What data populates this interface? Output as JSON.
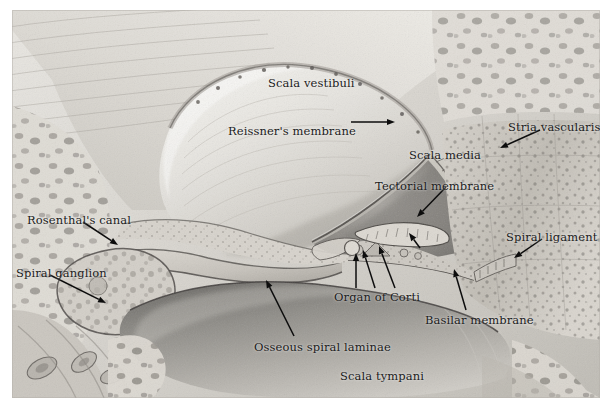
{
  "figure": {
    "background_color": "#ffffff",
    "plate_tone": "#cfcdc8",
    "label_color": "#1b1b1b"
  },
  "labels": [
    {
      "id": "scala-vestibuli",
      "text": "Scala vestibuli",
      "x": 268,
      "y": 78,
      "has_arrow": false
    },
    {
      "id": "reissners-membrane",
      "text": "Reissner's membrane",
      "x": 228,
      "y": 126,
      "has_arrow": true
    },
    {
      "id": "stria-vascularis",
      "text": "Stria vascularis",
      "x": 508,
      "y": 122,
      "has_arrow": true
    },
    {
      "id": "scala-media",
      "text": "Scala media",
      "x": 409,
      "y": 150,
      "has_arrow": false
    },
    {
      "id": "tectorial-membrane",
      "text": "Tectorial membrane",
      "x": 375,
      "y": 181,
      "has_arrow": true
    },
    {
      "id": "rosenthals-canal",
      "text": "Rosenthal's canal",
      "x": 27,
      "y": 215,
      "has_arrow": true
    },
    {
      "id": "spiral-ligament",
      "text": "Spiral ligament",
      "x": 506,
      "y": 232,
      "has_arrow": true
    },
    {
      "id": "spiral-ganglion",
      "text": "Spiral ganglion",
      "x": 16,
      "y": 268,
      "has_arrow": true
    },
    {
      "id": "organ-of-corti",
      "text": "Organ of Corti",
      "x": 334,
      "y": 292,
      "has_arrow": true
    },
    {
      "id": "basilar-membrane",
      "text": "Basilar membrane",
      "x": 425,
      "y": 315,
      "has_arrow": true
    },
    {
      "id": "osseous-spiral-laminae",
      "text": "Osseous spiral laminae",
      "x": 254,
      "y": 342,
      "has_arrow": true
    },
    {
      "id": "scala-tympani",
      "text": "Scala tympani",
      "x": 340,
      "y": 371,
      "has_arrow": false
    }
  ],
  "arrows": [
    {
      "id": "arrow-reissners-membrane",
      "from": [
        351,
        122
      ],
      "to": [
        395,
        122
      ]
    },
    {
      "id": "arrow-stria-vascularis",
      "from": [
        540,
        130
      ],
      "to": [
        500,
        148
      ]
    },
    {
      "id": "arrow-tectorial-membrane",
      "from": [
        446,
        187
      ],
      "to": [
        417,
        217
      ]
    },
    {
      "id": "arrow-rosenthals-canal",
      "from": [
        83,
        222
      ],
      "to": [
        118,
        245
      ]
    },
    {
      "id": "arrow-spiral-ligament",
      "from": [
        542,
        239
      ],
      "to": [
        514,
        258
      ]
    },
    {
      "id": "arrow-spiral-ganglion",
      "from": [
        50,
        275
      ],
      "to": [
        106,
        303
      ]
    },
    {
      "id": "arrow-organ-of-corti-1",
      "from": [
        356,
        288
      ],
      "to": [
        356,
        253
      ]
    },
    {
      "id": "arrow-organ-of-corti-2",
      "from": [
        375,
        288
      ],
      "to": [
        363,
        250
      ]
    },
    {
      "id": "arrow-organ-of-corti-3",
      "from": [
        395,
        288
      ],
      "to": [
        379,
        246
      ]
    },
    {
      "id": "arrow-tectorial-lower",
      "from": [
        420,
        248
      ],
      "to": [
        409,
        233
      ]
    },
    {
      "id": "arrow-basilar-membrane",
      "from": [
        466,
        310
      ],
      "to": [
        454,
        269
      ]
    },
    {
      "id": "arrow-osseous-spiral-laminae",
      "from": [
        294,
        336
      ],
      "to": [
        266,
        280
      ]
    }
  ]
}
